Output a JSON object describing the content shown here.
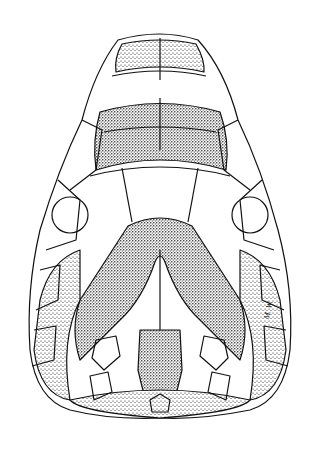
{
  "illustration": {
    "subject": "dorsal view of reptile head scale pattern",
    "style": "pen-and-ink stipple drawing",
    "ink_color": "#111111",
    "background_color": "#ffffff",
    "signature": "M. W."
  }
}
